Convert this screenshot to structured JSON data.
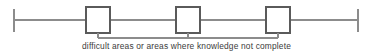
{
  "diagram": {
    "type": "annotated-timeline-bracket",
    "caption": "difficult areas or areas where knowledge not complete",
    "colors": {
      "line": "#8c8c8c",
      "box_stroke": "#5a5a5a",
      "box_fill": "#ffffff",
      "bracket": "#8c8c8c",
      "text": "#3b3b3b",
      "background": "#ffffff"
    },
    "axis": {
      "name": "horizontal-axis",
      "y": 20,
      "x_start": 14,
      "x_end": 358,
      "stroke_width": 1.6
    },
    "end_ticks": [
      {
        "name": "left-end-tick",
        "x": 14,
        "y_top": 9,
        "y_bottom": 32
      },
      {
        "name": "right-end-tick",
        "x": 358,
        "y_top": 9,
        "y_bottom": 32
      }
    ],
    "boxes": [
      {
        "name": "box-1",
        "x": 86,
        "y": 7,
        "width": 24,
        "height": 26,
        "center_x": 98
      },
      {
        "name": "box-2",
        "x": 176,
        "y": 7,
        "width": 24,
        "height": 26,
        "center_x": 188
      },
      {
        "name": "box-3",
        "x": 266,
        "y": 7,
        "width": 24,
        "height": 26,
        "center_x": 278
      }
    ],
    "bracket": {
      "name": "grouping-bracket",
      "y": 38,
      "x_start": 98,
      "x_end": 278,
      "stub_top": 33,
      "stub_positions": [
        98,
        188,
        278
      ]
    }
  }
}
